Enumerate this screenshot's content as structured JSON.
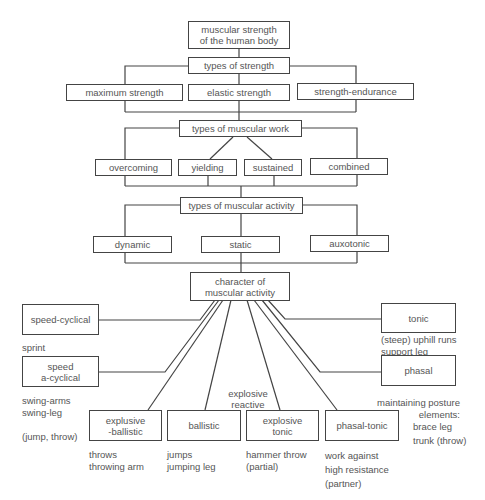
{
  "diagram": {
    "root": "muscular strength\nof the human body",
    "types_of_strength": {
      "label": "types of strength",
      "items": [
        "maximum strength",
        "elastic strength",
        "strength-endurance"
      ]
    },
    "types_of_muscular_work": {
      "label": "types of muscular work",
      "items": [
        "overcoming",
        "yielding",
        "sustained",
        "combined"
      ]
    },
    "types_of_muscular_activity": {
      "label": "types of muscular activity",
      "items": [
        "dynamic",
        "static",
        "auxotonic"
      ]
    },
    "character_of_muscular_activity": {
      "label": "character of\nmuscular activity",
      "categories": [
        {
          "label": "speed-cyclical",
          "examples": "sprint"
        },
        {
          "label": "speed\na-cyclical",
          "examples": "swing-arms\nswing-leg\n\n(jump, throw)"
        },
        {
          "label": "explusive\n-ballistic",
          "examples": "throws\nthrowing arm"
        },
        {
          "label": "ballistic",
          "examples": "jumps\njumping leg"
        },
        {
          "label": "explosive\ntonic",
          "examples": "hammer throw\n(partial)"
        },
        {
          "label": "phasal-tonic",
          "examples": "work against\nhigh resistance\n(partner)"
        },
        {
          "label": "tonic",
          "examples": "(steep) uphill runs\nsupport leg"
        },
        {
          "label": "phasal",
          "examples": "brace leg\ntrunk (throw)"
        }
      ],
      "group_label_explosive_reactive": "explosive\nreactive",
      "maintaining_posture_label": "maintaining posture\nelements:"
    }
  }
}
